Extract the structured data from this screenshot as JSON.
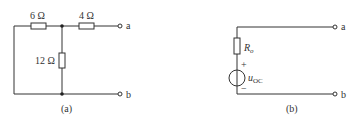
{
  "figure_a": {
    "caption": "(a)",
    "resistor_left": "6 Ω",
    "resistor_right": "4 Ω",
    "resistor_shunt": "12 Ω",
    "terminal_top": "a",
    "terminal_bottom": "b"
  },
  "figure_b": {
    "caption": "(b)",
    "resistor_label_main": "R",
    "resistor_label_sub": "o",
    "source_label_main": "u",
    "source_label_sub": "OC",
    "plus": "+",
    "minus": "−",
    "terminal_top": "a",
    "terminal_bottom": "b"
  }
}
